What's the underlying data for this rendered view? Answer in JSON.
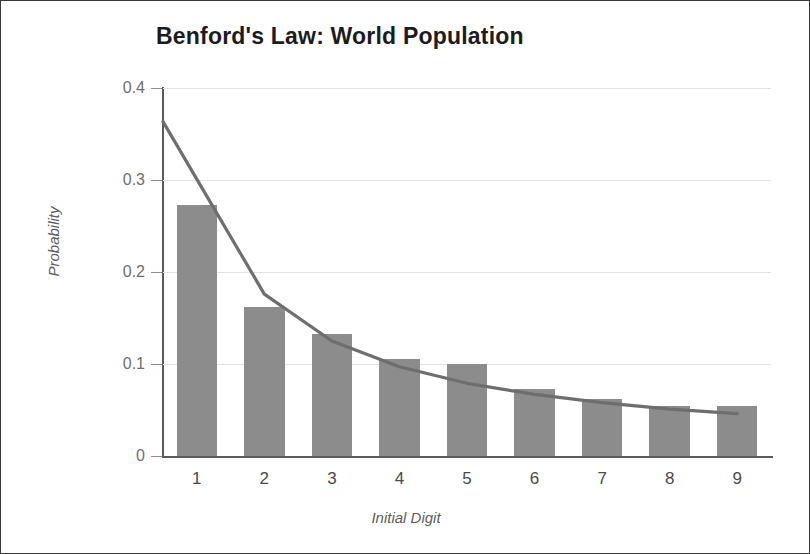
{
  "chart_data": {
    "type": "bar",
    "title": "Benford's Law: World Population",
    "xlabel": "Initial Digit",
    "ylabel": "Probability",
    "categories": [
      "1",
      "2",
      "3",
      "4",
      "5",
      "6",
      "7",
      "8",
      "9"
    ],
    "values": [
      0.273,
      0.162,
      0.133,
      0.105,
      0.1,
      0.073,
      0.062,
      0.054,
      0.054
    ],
    "series": [
      {
        "name": "World Population observed",
        "type": "bar",
        "values": [
          0.273,
          0.162,
          0.133,
          0.105,
          0.1,
          0.073,
          0.062,
          0.054,
          0.054
        ],
        "color": "#8c8c8c"
      },
      {
        "name": "Benford's Law predicted",
        "type": "line",
        "values": [
          0.301,
          0.176,
          0.125,
          0.097,
          0.079,
          0.067,
          0.058,
          0.051,
          0.046
        ],
        "color": "#6e6e6e"
      }
    ],
    "ylim": [
      0,
      0.4
    ],
    "ytick_labels": [
      "0",
      "0.1",
      "0.2",
      "0.3",
      "0.4"
    ],
    "ytick_values": [
      0,
      0.1,
      0.2,
      0.3,
      0.4
    ],
    "grid": "horizontal",
    "legend_position": "none",
    "bar_color": "#8c8c8c",
    "line_color": "#6e6e6e",
    "grid_color": "#e2e2e2",
    "axis_color": "#5b5b5b"
  }
}
